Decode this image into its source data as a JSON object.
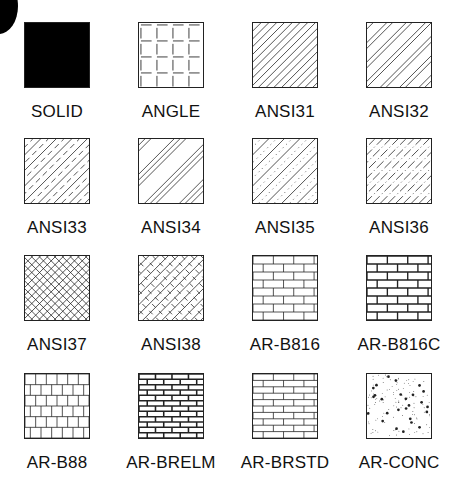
{
  "badge": {
    "shape": "circle-fragment",
    "color": "#000000"
  },
  "patterns": [
    {
      "name": "SOLID",
      "type": "solid"
    },
    {
      "name": "ANGLE",
      "type": "angle"
    },
    {
      "name": "ANSI31",
      "type": "diag",
      "spacing": 8
    },
    {
      "name": "ANSI32",
      "type": "diag-pairs"
    },
    {
      "name": "ANSI33",
      "type": "diag-dash"
    },
    {
      "name": "ANSI34",
      "type": "diag-triple"
    },
    {
      "name": "ANSI35",
      "type": "diag-dot"
    },
    {
      "name": "ANSI36",
      "type": "diag-dashdot"
    },
    {
      "name": "ANSI37",
      "type": "crosshatch"
    },
    {
      "name": "ANSI38",
      "type": "crosshatch-dash"
    },
    {
      "name": "AR-B816",
      "type": "brick"
    },
    {
      "name": "AR-B816C",
      "type": "brick-bold"
    },
    {
      "name": "AR-B88",
      "type": "brick-small"
    },
    {
      "name": "AR-BRELM",
      "type": "brick-elm"
    },
    {
      "name": "AR-BRSTD",
      "type": "brick-std"
    },
    {
      "name": "AR-CONC",
      "type": "concrete"
    }
  ]
}
